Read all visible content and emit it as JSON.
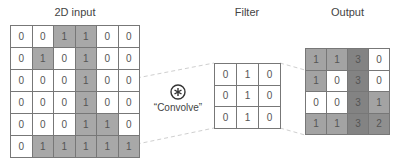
{
  "input": {
    "title": "2D input",
    "rows": [
      [
        0,
        0,
        1,
        1,
        0,
        0
      ],
      [
        0,
        1,
        0,
        1,
        0,
        0
      ],
      [
        0,
        0,
        0,
        1,
        0,
        0
      ],
      [
        0,
        0,
        0,
        1,
        0,
        0
      ],
      [
        0,
        0,
        0,
        1,
        1,
        0
      ],
      [
        0,
        1,
        1,
        1,
        1,
        1
      ]
    ]
  },
  "operator": {
    "symbol": "circled-asterisk-icon",
    "label": "“Convolve”"
  },
  "filter": {
    "title": "Filter",
    "rows": [
      [
        0,
        1,
        0
      ],
      [
        0,
        1,
        0
      ],
      [
        0,
        1,
        0
      ]
    ]
  },
  "output": {
    "title": "Output",
    "rows": [
      [
        1,
        1,
        3,
        0
      ],
      [
        1,
        0,
        3,
        0
      ],
      [
        0,
        0,
        3,
        1
      ],
      [
        1,
        1,
        3,
        2
      ]
    ]
  },
  "colors": {
    "border": "#777777",
    "shade_1": "#a3a3a3",
    "shade_2": "#8f8f8f",
    "shade_3": "#838383",
    "dashed": "#cccccc"
  }
}
